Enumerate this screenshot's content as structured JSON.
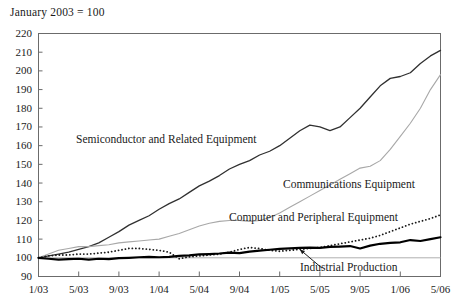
{
  "chart_data": {
    "type": "line",
    "title": "January 2003 = 100",
    "xlabel": "",
    "ylabel": "",
    "ylim": [
      90,
      220
    ],
    "ytick_labels": [
      "220",
      "210",
      "200",
      "190",
      "180",
      "170",
      "160",
      "150",
      "140",
      "130",
      "120",
      "110",
      "100",
      "90"
    ],
    "ytick_values": [
      220,
      210,
      200,
      190,
      180,
      170,
      160,
      150,
      140,
      130,
      120,
      110,
      100,
      90
    ],
    "xtick_labels": [
      "1/03",
      "5/03",
      "9/03",
      "1/04",
      "5/04",
      "9/04",
      "1/05",
      "5/05",
      "9/05",
      "1/06",
      "5/06"
    ],
    "xtick_values": [
      0,
      4,
      8,
      12,
      16,
      20,
      24,
      28,
      32,
      36,
      40
    ],
    "xlim": [
      0,
      40
    ],
    "grid": "horizontal-reference-line-at-100",
    "reference_line": 100,
    "legend_position": "inline-annotations",
    "x": [
      "1/03",
      "2/03",
      "3/03",
      "4/03",
      "5/03",
      "6/03",
      "7/03",
      "8/03",
      "9/03",
      "10/03",
      "11/03",
      "12/03",
      "1/04",
      "2/04",
      "3/04",
      "4/04",
      "5/04",
      "6/04",
      "7/04",
      "8/04",
      "9/04",
      "10/04",
      "11/04",
      "12/04",
      "1/05",
      "2/05",
      "3/05",
      "4/05",
      "5/05",
      "6/05",
      "7/05",
      "8/05",
      "9/05",
      "10/05",
      "11/05",
      "12/05",
      "1/06",
      "2/06",
      "3/06",
      "4/06",
      "5/06"
    ],
    "series": [
      {
        "name": "Semiconductor and Related Equipment",
        "style": "solid-dark",
        "color": "#303030",
        "width": 1.3,
        "values": [
          100,
          101,
          102,
          103,
          104.5,
          106,
          108,
          111,
          114,
          117.5,
          120,
          122.5,
          126,
          129,
          131.5,
          135,
          138.5,
          141,
          144,
          147.5,
          150,
          152,
          155,
          157,
          160,
          164,
          168,
          171,
          170,
          168,
          170,
          175,
          180,
          186,
          192,
          196,
          197,
          199,
          204,
          208,
          211
        ]
      },
      {
        "name": "Communications Equipment",
        "style": "solid-light",
        "color": "#a8a8a8",
        "width": 1.1,
        "values": [
          100,
          102,
          104,
          105,
          106,
          106,
          106.5,
          107,
          108,
          108.5,
          109,
          109.5,
          110,
          111.5,
          113,
          115,
          117,
          118.5,
          119.5,
          120,
          120,
          119.5,
          120,
          121.5,
          124,
          127,
          130,
          133,
          136,
          139,
          142,
          145,
          148,
          149,
          152,
          158,
          165,
          172,
          180,
          190,
          198
        ]
      },
      {
        "name": "Computer and Peripheral Equipment",
        "style": "dotted",
        "color": "#1a1a1a",
        "width": 1.8,
        "values": [
          100,
          101,
          101.5,
          101.5,
          102,
          102,
          102.5,
          103,
          104,
          105,
          105,
          104.5,
          104,
          103,
          99.5,
          100.5,
          101,
          101.5,
          102,
          103,
          104.5,
          105.5,
          105,
          104,
          103.5,
          104,
          104.5,
          105,
          105.5,
          106.5,
          107.5,
          108.5,
          109.5,
          110.5,
          112,
          114,
          116,
          118,
          119.5,
          121,
          123
        ]
      },
      {
        "name": "Industrial Production",
        "style": "solid-thick",
        "color": "#000000",
        "width": 2.2,
        "values": [
          100,
          99.5,
          99,
          99.3,
          99.5,
          99,
          99.5,
          99.3,
          99.8,
          100,
          100.3,
          100.5,
          100.3,
          100.5,
          101,
          101.3,
          101.8,
          102,
          102.3,
          102.8,
          102.5,
          103.3,
          103.8,
          104.3,
          104.8,
          105,
          105.3,
          105.5,
          105.3,
          105.8,
          106,
          106.3,
          105,
          106.5,
          107.5,
          108,
          108.3,
          109.5,
          109,
          110,
          111
        ]
      }
    ],
    "annotations": [
      {
        "name": "industrial-production-arrow",
        "text": "",
        "from": [
          28.2,
          94.5
        ],
        "to": [
          26.0,
          104.5
        ]
      }
    ]
  },
  "labels": {
    "semiconductor": "Semiconductor and Related Equipment",
    "communications": "Communications Equipment",
    "computer": "Computer and Peripheral Equipment",
    "industrial": "Industrial Production"
  },
  "colors": {
    "frame": "#6b6b6b",
    "reference_line": "#b0b0b0",
    "semiconductor": "#303030",
    "communications": "#a8a8a8",
    "computer": "#1a1a1a",
    "industrial": "#000000",
    "text": "#1a1a1a",
    "background": "#ffffff"
  }
}
